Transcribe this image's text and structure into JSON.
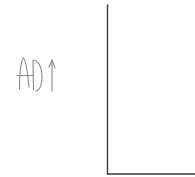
{
  "diagram": {
    "type": "hand-drawn axes sketch",
    "y_axis_label": "AD",
    "y_axis_label_arrow": "up-arrow",
    "x_axis_label": "",
    "stroke_color": "#3a3a3a",
    "label_color": "#8a8a8a",
    "background_color": "#ffffff"
  }
}
